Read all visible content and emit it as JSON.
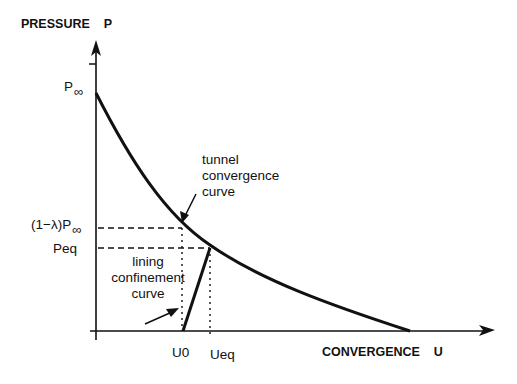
{
  "diagram": {
    "y_axis_label": "PRESSURE    P",
    "x_axis_label": "CONVERGENCE    U",
    "p_inf_label": "P",
    "p_inf_sub": "∞",
    "reduced_pressure_label": "(1−λ)P",
    "reduced_pressure_sub": "∞",
    "peq_label": "Peq",
    "u0_label": "U0",
    "ueq_label": "Ueq",
    "tunnel_curve_label": [
      "tunnel",
      "convergence",
      "curve"
    ],
    "lining_curve_label": [
      "lining",
      "confinement",
      "curve"
    ],
    "line_color": "#111111"
  }
}
